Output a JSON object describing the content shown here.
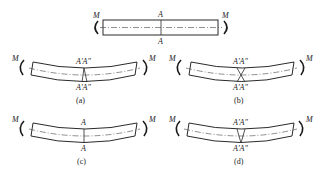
{
  "figure": {
    "top": {
      "moment_left": "M",
      "moment_right": "M",
      "section_top": "A",
      "section_bottom": "A"
    },
    "panels": [
      {
        "id": "a",
        "caption": "(a)",
        "moment_left": "M",
        "moment_right": "M",
        "top_labels": "A'A\"",
        "bottom_labels": "A'A\""
      },
      {
        "id": "b",
        "caption": "(b)",
        "moment_left": "M",
        "moment_right": "M",
        "top_labels": "A'A\"",
        "bottom_labels": "A'A\""
      },
      {
        "id": "c",
        "caption": "(c)",
        "moment_left": "M",
        "moment_right": "M",
        "top_labels": "A",
        "bottom_labels": "A"
      },
      {
        "id": "d",
        "caption": "(d)",
        "moment_left": "M",
        "moment_right": "M",
        "top_labels": "A'A\"",
        "bottom_labels": "A'A\""
      }
    ]
  }
}
